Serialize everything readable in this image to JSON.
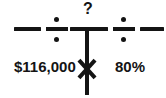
{
  "diagram": {
    "type": "math-equation-strip",
    "stroke_color": "#141414",
    "background_color": "#ffffff",
    "labels": {
      "unknown": "?",
      "amount": "$116,000",
      "percent": "80%"
    },
    "operators": {
      "dash_left": "minus-dash",
      "divide_left": "÷",
      "divide_right": "÷",
      "dash_right": "minus-dash",
      "multiply": "×"
    },
    "structure": {
      "top_branch_label": "?",
      "left_operand": "$116,000",
      "right_operand": "80%",
      "junction": "t-junction"
    }
  }
}
